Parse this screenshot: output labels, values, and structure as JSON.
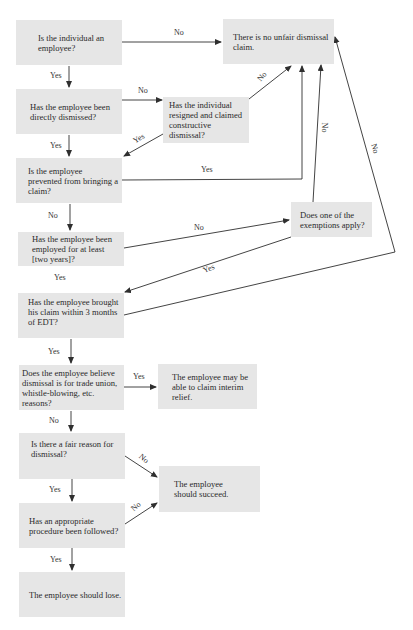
{
  "diagram": {
    "type": "flowchart",
    "nodes": {
      "q_employee": "Is the individual an employee?",
      "q_dismissed": "Has the employee been directly dismissed?",
      "q_resigned": "Has the individual resigned and claimed constructive dismissal?",
      "q_prevented": "Is the employee prevented from bringing a claim?",
      "q_two_years": "Has the employee been employed for at least [two years]?",
      "q_exemptions": "Does one of the exemptions apply?",
      "q_three_months": "Has the employee brought his claim within 3 months of EDT?",
      "q_trade_union": "Does the employee believe dismissal is for trade union, whistle-blowing, etc. reasons?",
      "q_fair_reason": "Is there a fair reason for dismissal?",
      "q_procedure": "Has an appropriate procedure been followed?",
      "r_no_claim": "There is no unfair dismissal claim.",
      "r_interim": "The employee may be able to claim interim relief.",
      "r_succeed": "The employee should succeed.",
      "r_lose": "The employee should lose."
    },
    "edge_labels": {
      "employee_no": "No",
      "employee_yes": "Yes",
      "dismissed_no": "No",
      "dismissed_yes": "Yes",
      "resigned_no": "No",
      "resigned_yes": "Yes",
      "prevented_yes": "Yes",
      "prevented_no": "No",
      "two_years_no": "No",
      "two_years_yes": "Yes",
      "exemptions_no": "No",
      "exemptions_yes": "Yes",
      "three_months_no": "No",
      "three_months_yes": "Yes",
      "trade_union_yes": "Yes",
      "trade_union_no": "No",
      "fair_reason_no": "No",
      "fair_reason_yes": "Yes",
      "procedure_no": "No",
      "procedure_yes": "Yes"
    },
    "edges": [
      {
        "from": "q_employee",
        "to": "r_no_claim",
        "label": "No"
      },
      {
        "from": "q_employee",
        "to": "q_dismissed",
        "label": "Yes"
      },
      {
        "from": "q_dismissed",
        "to": "q_resigned",
        "label": "No"
      },
      {
        "from": "q_dismissed",
        "to": "q_prevented",
        "label": "Yes"
      },
      {
        "from": "q_resigned",
        "to": "r_no_claim",
        "label": "No"
      },
      {
        "from": "q_resigned",
        "to": "q_prevented",
        "label": "Yes"
      },
      {
        "from": "q_prevented",
        "to": "r_no_claim",
        "label": "Yes"
      },
      {
        "from": "q_prevented",
        "to": "q_two_years",
        "label": "No"
      },
      {
        "from": "q_two_years",
        "to": "q_exemptions",
        "label": "No"
      },
      {
        "from": "q_two_years",
        "to": "q_three_months",
        "label": "Yes"
      },
      {
        "from": "q_exemptions",
        "to": "r_no_claim",
        "label": "No"
      },
      {
        "from": "q_exemptions",
        "to": "q_three_months",
        "label": "Yes"
      },
      {
        "from": "q_three_months",
        "to": "r_no_claim",
        "label": "No"
      },
      {
        "from": "q_three_months",
        "to": "q_trade_union",
        "label": "Yes"
      },
      {
        "from": "q_trade_union",
        "to": "r_interim",
        "label": "Yes"
      },
      {
        "from": "q_trade_union",
        "to": "q_fair_reason",
        "label": "No"
      },
      {
        "from": "q_fair_reason",
        "to": "r_succeed",
        "label": "No"
      },
      {
        "from": "q_fair_reason",
        "to": "q_procedure",
        "label": "Yes"
      },
      {
        "from": "q_procedure",
        "to": "r_succeed",
        "label": "No"
      },
      {
        "from": "q_procedure",
        "to": "r_lose",
        "label": "Yes"
      }
    ],
    "colors": {
      "box_fill": "#e6e6e6",
      "line": "#2f2f2f",
      "text": "#2a2a2a"
    }
  }
}
